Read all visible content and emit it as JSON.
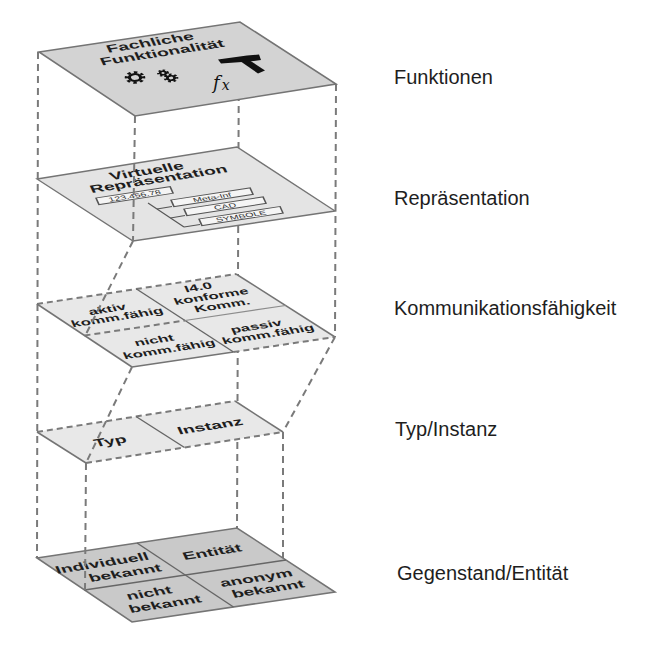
{
  "layers": [
    {
      "label": "Funktionen",
      "title": [
        "Fachliche",
        "Funktionalität"
      ],
      "icons": [
        "gears-icon",
        "hammer-icon",
        "fx-icon"
      ],
      "fx": {
        "f": "f",
        "x": "x"
      }
    },
    {
      "label": "Repräsentation",
      "title": [
        "Virtuelle",
        "Repräsentation"
      ],
      "id_value": "123.456.78",
      "children": [
        "Meta-Inf",
        "CAD",
        "SYMBOLE"
      ]
    },
    {
      "label": "Kommunikationsfähigkeit",
      "cells": [
        {
          "lines": [
            "aktiv",
            "komm.fähig"
          ]
        },
        {
          "lines": [
            "I4.0",
            "konforme",
            "Komm."
          ]
        },
        {
          "lines": [
            "nicht",
            "komm.fähig"
          ]
        },
        {
          "lines": [
            "passiv",
            "komm.fähig"
          ]
        }
      ]
    },
    {
      "label": "Typ/Instanz",
      "cells": [
        {
          "lines": [
            "Typ"
          ]
        },
        {
          "lines": [
            "Instanz"
          ]
        }
      ]
    },
    {
      "label": "Gegenstand/Entität",
      "cells": [
        {
          "lines": [
            "Individuell",
            "bekannt"
          ]
        },
        {
          "lines": [
            "Entität"
          ]
        },
        {
          "lines": [
            "nicht",
            "bekannt"
          ]
        },
        {
          "lines": [
            "anonym",
            "bekannt"
          ]
        }
      ]
    }
  ],
  "colors": {
    "plane-functions": "#d3d3d3",
    "plane-representation": "#e4e4e4",
    "plane-communication": "#e8e8e8",
    "plane-type": "#e8e8e8",
    "plane-entity": "#c9c9c9",
    "edge": "#747474",
    "dash": "#7a7a7a",
    "text": "#1e1e1e"
  }
}
